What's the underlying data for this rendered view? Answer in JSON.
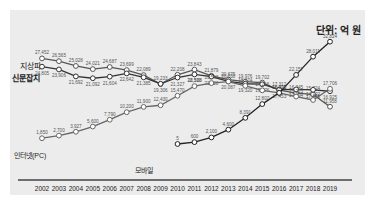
{
  "unit_label": "단위: 억 원",
  "chart_data": {
    "type": "line",
    "title": "",
    "unit": "단위: 억 원",
    "xlabel": "",
    "ylabel": "",
    "grid": false,
    "legend_position": "inline-left",
    "x": [
      "2002",
      "2003",
      "2004",
      "2005",
      "2006",
      "2007",
      "2008",
      "2009",
      "2010",
      "2011",
      "2012",
      "2013",
      "2014",
      "2015",
      "2016",
      "2017",
      "2018",
      "2019"
    ],
    "series": [
      {
        "name": "지상파",
        "values": [
          27452,
          26565,
          25028,
          24021,
          24687,
          23699,
          22089,
          19233,
          22208,
          23843,
          21879,
          20675,
          19976,
          19702,
          17312,
          16345,
          15924,
          11958
        ],
        "marker": "open-circle",
        "color": "#555555"
      },
      {
        "name": "신문잡지",
        "values": [
          24805,
          23906,
          21692,
          21092,
          21604,
          22642,
          21385,
          19306,
          21327,
          22328,
          21620,
          20087,
          19320,
          19176,
          17453,
          17494,
          17376,
          16925
        ],
        "marker": "open-circle",
        "color": "#333333"
      },
      {
        "name": "인터넷(PC)",
        "values": [
          1850,
          2700,
          3927,
          5600,
          7790,
          10200,
          11900,
          12430,
          15470,
          18560,
          19540,
          20030,
          18674,
          17216,
          16372,
          15223,
          14122,
          17706
        ],
        "marker": "open-circle",
        "color": "#666666"
      },
      {
        "name": "모바일",
        "values": [
          null,
          null,
          null,
          null,
          null,
          null,
          null,
          null,
          5,
          600,
          2100,
          4600,
          8391,
          12802,
          16400,
          22157,
          28011,
          32824
        ],
        "marker": "open-circle",
        "color": "#222222"
      }
    ],
    "ylim": [
      0,
      34000
    ]
  }
}
